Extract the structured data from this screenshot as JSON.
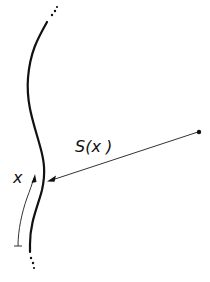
{
  "diagram": {
    "title": "",
    "labels": {
      "distance_label": "S(x )",
      "arc_length_label": "x"
    },
    "elements": {
      "curve": "solid wavy vertical curve with dotted continuation at both ends",
      "distance_arrow": "thin line from a point on the right, with an arrowhead ending at the curve",
      "source_point": "small filled dot at right end of the distance line",
      "arc_length_arrow": "thin curved arrow parallel to the curve pointing upward, with a bar at its start"
    },
    "colors": {
      "stroke": "#111111",
      "thin_stroke": "#333333",
      "background": "#ffffff"
    }
  }
}
